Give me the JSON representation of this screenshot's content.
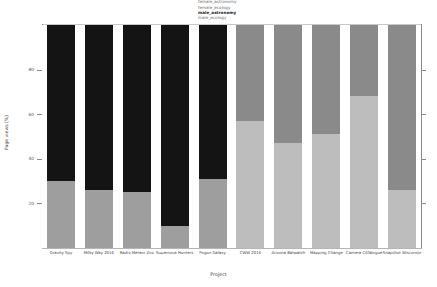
{
  "chart_data": {
    "type": "bar",
    "stacked": true,
    "normalized_percent": true,
    "title": "",
    "xlabel": "Project",
    "ylabel": "Page views (%)",
    "ylim": [
      0,
      100
    ],
    "yticks": [
      20,
      40,
      60,
      80
    ],
    "ytick_labels": [
      "20",
      "40",
      "60",
      "80"
    ],
    "grid": false,
    "legend_position": "top-center",
    "categories": [
      "Gravity Spy",
      "Milky Way 2016",
      "Radio Meteor Zoo",
      "Supernova Hunters",
      "Pogon Galaxy",
      "CWW 2016",
      "Arizona Batwatch",
      "Mapping Change",
      "Camera CATalogue",
      "Snapshot Wisconsin"
    ],
    "series": [
      {
        "name": "female_astronomy",
        "color": "#9e9e9e",
        "values": [
          30,
          26,
          25,
          10,
          31,
          null,
          null,
          null,
          null,
          null
        ]
      },
      {
        "name": "female_ecology",
        "color": "#bdbdbd",
        "values": [
          null,
          null,
          null,
          null,
          null,
          57,
          47,
          51,
          68,
          26
        ]
      },
      {
        "name": "male_astronomy",
        "color": "#141414",
        "values": [
          70,
          74,
          75,
          90,
          69,
          null,
          null,
          null,
          null,
          null
        ]
      },
      {
        "name": "male_ecology",
        "color": "#8a8a8a",
        "values": [
          null,
          null,
          null,
          null,
          null,
          43,
          53,
          49,
          32,
          74
        ]
      }
    ],
    "bars": [
      {
        "category": "Gravity Spy",
        "group": "astronomy",
        "bottom_label": "female_astronomy",
        "bottom_value": 30,
        "top_label": "male_astronomy",
        "top_value": 70
      },
      {
        "category": "Milky Way 2016",
        "group": "astronomy",
        "bottom_label": "female_astronomy",
        "bottom_value": 26,
        "top_label": "male_astronomy",
        "top_value": 74
      },
      {
        "category": "Radio Meteor Zoo",
        "group": "astronomy",
        "bottom_label": "female_astronomy",
        "bottom_value": 25,
        "top_label": "male_astronomy",
        "top_value": 75
      },
      {
        "category": "Supernova Hunters",
        "group": "astronomy",
        "bottom_label": "female_astronomy",
        "bottom_value": 10,
        "top_label": "male_astronomy",
        "top_value": 90
      },
      {
        "category": "Pogon Galaxy",
        "group": "astronomy",
        "bottom_label": "female_astronomy",
        "bottom_value": 31,
        "top_label": "male_astronomy",
        "top_value": 69
      },
      {
        "category": "CWW 2016",
        "group": "ecology",
        "bottom_label": "female_ecology",
        "bottom_value": 57,
        "top_label": "male_ecology",
        "top_value": 43
      },
      {
        "category": "Arizona Batwatch",
        "group": "ecology",
        "bottom_label": "female_ecology",
        "bottom_value": 47,
        "top_label": "male_ecology",
        "top_value": 53
      },
      {
        "category": "Mapping Change",
        "group": "ecology",
        "bottom_label": "female_ecology",
        "bottom_value": 51,
        "top_label": "male_ecology",
        "top_value": 49
      },
      {
        "category": "Camera CATalogue",
        "group": "ecology",
        "bottom_label": "female_ecology",
        "bottom_value": 68,
        "top_label": "male_ecology",
        "top_value": 32
      },
      {
        "category": "Snapshot Wisconsin",
        "group": "ecology",
        "bottom_label": "female_ecology",
        "bottom_value": 26,
        "top_label": "male_ecology",
        "top_value": 74
      }
    ],
    "legend_entries": [
      {
        "label": "female_astronomy",
        "color": "#9e9e9e",
        "emphasis": false
      },
      {
        "label": "female_ecology",
        "color": "#bdbdbd",
        "emphasis": false
      },
      {
        "label": "male_astronomy",
        "color": "#141414",
        "emphasis": true
      },
      {
        "label": "male_ecology",
        "color": "#8a8a8a",
        "emphasis": false
      }
    ]
  },
  "axes": {
    "y_title": "Page views (%)",
    "x_title": "Project",
    "y_tick_labels": [
      "20",
      "40",
      "60",
      "80"
    ]
  },
  "colors": {
    "female_astronomy": "#9e9e9e",
    "female_ecology": "#bdbdbd",
    "male_astronomy": "#141414",
    "male_ecology": "#8a8a8a",
    "axis": "#8a8a8a",
    "text": "#3d3d3d",
    "background": "#ffffff"
  },
  "footer": {
    "note": ""
  }
}
